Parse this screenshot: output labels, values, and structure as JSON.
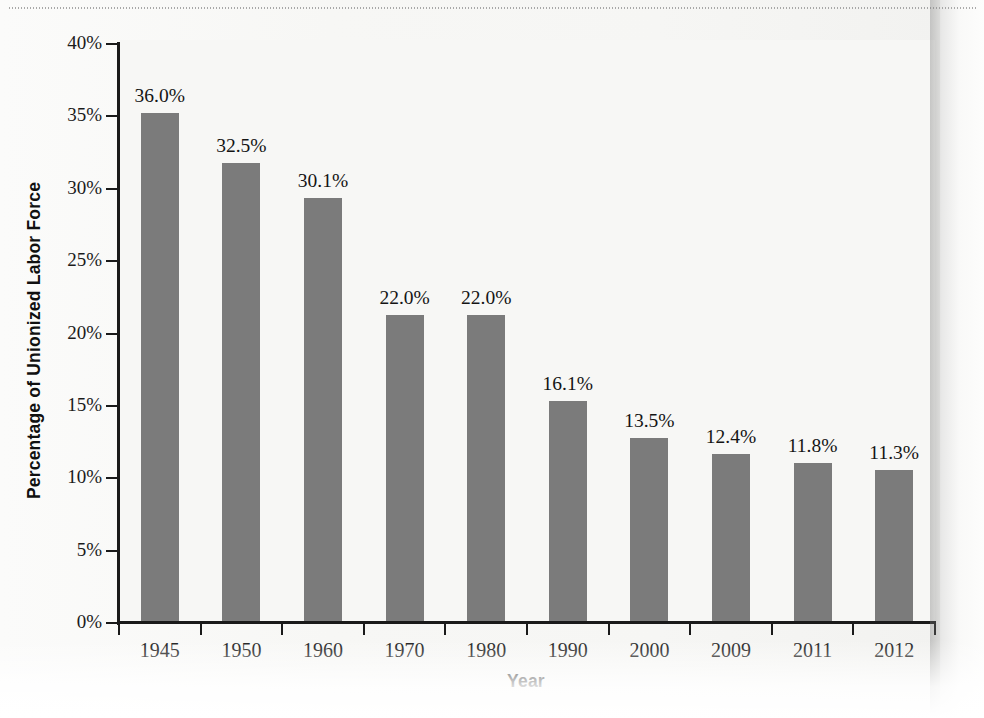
{
  "chart_data": {
    "type": "bar",
    "title": "",
    "xlabel": "Year",
    "ylabel": "Percentage of Unionized Labor Force",
    "categories": [
      "1945",
      "1950",
      "1960",
      "1970",
      "1980",
      "1990",
      "2000",
      "2009",
      "2011",
      "2012"
    ],
    "values": [
      36.0,
      32.5,
      30.1,
      22.0,
      22.0,
      16.1,
      13.5,
      12.4,
      11.8,
      11.3
    ],
    "data_labels": [
      "36.0%",
      "32.5%",
      "30.1%",
      "22.0%",
      "22.0%",
      "16.1%",
      "13.5%",
      "12.4%",
      "11.8%",
      "11.3%"
    ],
    "ylim": [
      0,
      40
    ],
    "ytick_values": [
      0,
      5,
      10,
      15,
      20,
      25,
      30,
      35,
      40
    ],
    "ytick_labels": [
      "0%",
      "5%",
      "10%",
      "15%",
      "20%",
      "25%",
      "30%",
      "35%",
      "40%"
    ],
    "grid": false,
    "legend": null,
    "bar_color": "#7b7b7b",
    "axis_color": "#1a1a1a",
    "plot_background": "#f7f7f5"
  },
  "axes": {
    "y_title": "Percentage of Unionized Labor Force",
    "x_title": "Year"
  }
}
